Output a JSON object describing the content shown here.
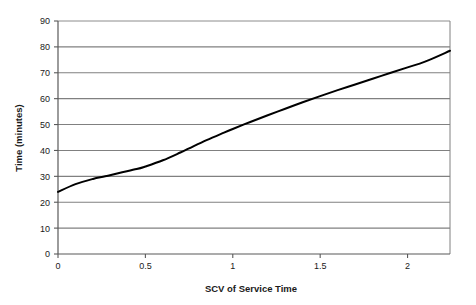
{
  "chart_data": {
    "type": "line",
    "title": "",
    "subtitle": "",
    "xlabel": "SCV of Service Time",
    "ylabel": "Time (minutes)",
    "xlim": [
      0,
      2.2428
    ],
    "ylim": [
      0,
      90
    ],
    "xticks": [
      0,
      0.5,
      1,
      1.5,
      2
    ],
    "xticklabels": [
      "0",
      "0.5",
      "1",
      "1.5",
      "2"
    ],
    "yticks": [
      0,
      10,
      20,
      30,
      40,
      50,
      60,
      70,
      80,
      90
    ],
    "yticklabels": [
      "0",
      "10",
      "20",
      "30",
      "40",
      "50",
      "60",
      "70",
      "80",
      "90"
    ],
    "grid": "horizontal",
    "legend": "none",
    "series": [
      {
        "name": "Time vs SCV",
        "color": "#000000",
        "linewidth": 2,
        "x": [
          0,
          0.1,
          0.2,
          0.27,
          0.35,
          0.45,
          0.5,
          0.6,
          0.7,
          0.75,
          0.85,
          0.95,
          1.0,
          1.1,
          1.2,
          1.3,
          1.4,
          1.5,
          1.6,
          1.7,
          1.8,
          1.9,
          2.0,
          2.1,
          2.2428
        ],
        "y": [
          24.0,
          27.0,
          29.0,
          30.0,
          31.3,
          32.8,
          33.8,
          36.2,
          39.2,
          40.8,
          44.0,
          46.9,
          48.3,
          51.0,
          53.6,
          56.1,
          58.6,
          61.0,
          63.3,
          65.5,
          67.7,
          69.9,
          72.1,
          74.3,
          78.5
        ]
      }
    ],
    "colors": {
      "line": "#000000",
      "grid": "#808080",
      "axis": "#595959",
      "text": "#1a1a1a",
      "background": "#ffffff"
    }
  },
  "axes": {
    "y_title": "Time (minutes)",
    "x_title": "SCV of Service Time"
  },
  "ytick_labels": [
    "90",
    "80",
    "70",
    "60",
    "50",
    "40",
    "30",
    "20",
    "10",
    "0"
  ],
  "xtick_labels": [
    "0",
    "0.5",
    "1",
    "1.5",
    "2"
  ]
}
